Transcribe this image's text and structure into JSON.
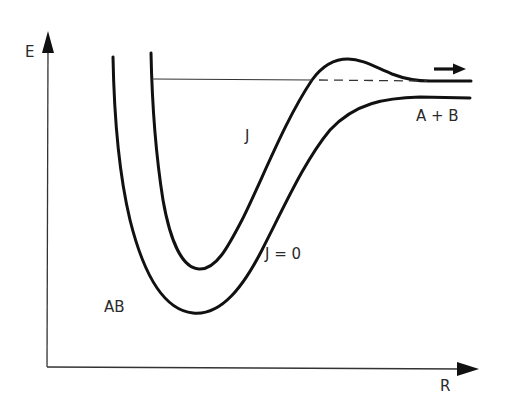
{
  "diagram": {
    "axes": {
      "y_label": "E",
      "x_label": "R"
    },
    "curves": [
      {
        "id": "rotating",
        "label": "J",
        "description": "effective potential with rotational quantum number J, showing a centrifugal barrier"
      },
      {
        "id": "nonrotating",
        "label": "J = 0",
        "description": "potential for J = 0"
      }
    ],
    "labels": {
      "molecule": "AB",
      "dissociation_products": "A + B",
      "curve_j": "J",
      "curve_j0": "J = 0"
    },
    "annotations": {
      "energy_level_line": "horizontal energy level (solid inside well, dashed under barrier)",
      "arrow": "right-pointing arrow indicating dissociation / tunneling toward A + B"
    },
    "colors": {
      "stroke": "#111111",
      "axis": "#333333",
      "text": "#2a2a2a",
      "background": "#ffffff"
    }
  }
}
